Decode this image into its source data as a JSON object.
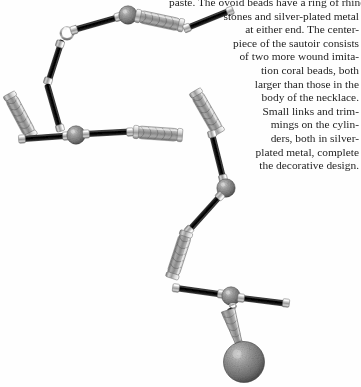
{
  "page": {
    "background_color": "#fefefe",
    "width": 361,
    "height": 387
  },
  "caption": {
    "text": "New York"
  },
  "body_text": {
    "full": "paste. The ovoid beads have a ring of rhinestones and silver-plated metal at either end. The centerpiece of the sautoir consists of two more wound imitation coral beads, both larger than those in the body of the necklace. Small links and trimmings on the cylinders, both in silver-plated metal, complete the decorative design.",
    "lines": [
      "paste. The ovoid beads have a ring of rhine-",
      "stones and silver-plated metal",
      "at either end. The center-",
      "piece of the sautoir consists",
      "of two more wound imita-",
      "tion coral beads, both",
      "larger than those in the",
      "body of the necklace.",
      "Small links and trim-",
      "mings on the cylin-",
      "ders, both in silver-",
      "plated metal, complete",
      "the decorative design."
    ]
  },
  "artwork": {
    "name": "art-deco-sautoir-necklace-photograph",
    "description": "Long Art Deco sautoir necklace photographed on white, zig-zagging from upper left to a pendant drop at lower right",
    "colors": {
      "black_bar": "#0d0d0d",
      "silver_light": "#e2e2e2",
      "silver_mid": "#a8a8a8",
      "silver_dark": "#6e6e6e",
      "bead_fill": "#8d8d8d",
      "bead_speckle": "#4a4a4a",
      "highlight": "#fdfdfd"
    },
    "components": {
      "clasp": "spring-ring-clasp",
      "black_bars": "black-enamel-cylinder-bar",
      "round_beads": "wound-imitation-coral-round-bead",
      "ornate_cylinders": "rhinestone-filigree-cylinder",
      "pendant": "large-wound-coral-pendant-bead"
    }
  }
}
